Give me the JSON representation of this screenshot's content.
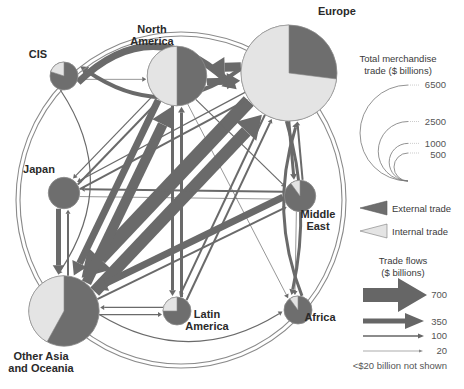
{
  "chart_data": {
    "type": "flow-map",
    "title": "",
    "colors": {
      "external": "#6e6e6e",
      "internal": "#e4e4e4",
      "flow": "#6a6a6a",
      "outline": "#8a8a8a"
    },
    "regions": [
      {
        "id": "europe",
        "label_lines": [
          "Europe"
        ],
        "total_trade": 6500,
        "internal_share": 0.73
      },
      {
        "id": "north-america",
        "label_lines": [
          "North",
          "America"
        ],
        "total_trade": 2500,
        "internal_share": 0.5
      },
      {
        "id": "cis",
        "label_lines": [
          "CIS"
        ],
        "total_trade": 500,
        "internal_share": 0.2
      },
      {
        "id": "japan",
        "label_lines": [
          "Japan"
        ],
        "total_trade": 700,
        "internal_share": 0.0
      },
      {
        "id": "middle-east",
        "label_lines": [
          "Middle",
          "East"
        ],
        "total_trade": 700,
        "internal_share": 0.1
      },
      {
        "id": "other-asia",
        "label_lines": [
          "Other Asia",
          "and Oceania"
        ],
        "total_trade": 3500,
        "internal_share": 0.42
      },
      {
        "id": "latin-america",
        "label_lines": [
          "Latin",
          "America"
        ],
        "total_trade": 500,
        "internal_share": 0.25
      },
      {
        "id": "africa",
        "label_lines": [
          "Africa"
        ],
        "total_trade": 500,
        "internal_share": 0.1
      }
    ],
    "flows": [
      {
        "from": "cis",
        "to": "europe",
        "value": 350
      },
      {
        "from": "europe",
        "to": "cis",
        "value": 200
      },
      {
        "from": "north-america",
        "to": "europe",
        "value": 350
      },
      {
        "from": "europe",
        "to": "north-america",
        "value": 450
      },
      {
        "from": "cis",
        "to": "north-america",
        "value": 20
      },
      {
        "from": "europe",
        "to": "other-asia",
        "value": 700
      },
      {
        "from": "other-asia",
        "to": "europe",
        "value": 600
      },
      {
        "from": "other-asia",
        "to": "north-america",
        "value": 500
      },
      {
        "from": "north-america",
        "to": "other-asia",
        "value": 350
      },
      {
        "from": "japan",
        "to": "other-asia",
        "value": 250
      },
      {
        "from": "other-asia",
        "to": "japan",
        "value": 100
      },
      {
        "from": "middle-east",
        "to": "other-asia",
        "value": 350
      },
      {
        "from": "other-asia",
        "to": "middle-east",
        "value": 100
      },
      {
        "from": "europe",
        "to": "middle-east",
        "value": 150
      },
      {
        "from": "middle-east",
        "to": "europe",
        "value": 100
      },
      {
        "from": "middle-east",
        "to": "japan",
        "value": 100
      },
      {
        "from": "japan",
        "to": "middle-east",
        "value": 20
      },
      {
        "from": "north-america",
        "to": "latin-america",
        "value": 150
      },
      {
        "from": "latin-america",
        "to": "north-america",
        "value": 150
      },
      {
        "from": "other-asia",
        "to": "latin-america",
        "value": 50
      },
      {
        "from": "latin-america",
        "to": "other-asia",
        "value": 50
      },
      {
        "from": "europe",
        "to": "africa",
        "value": 150
      },
      {
        "from": "africa",
        "to": "europe",
        "value": 150
      },
      {
        "from": "north-america",
        "to": "africa",
        "value": 20
      },
      {
        "from": "middle-east",
        "to": "africa",
        "value": 20
      },
      {
        "from": "japan",
        "to": "north-america",
        "value": 100
      },
      {
        "from": "north-america",
        "to": "japan",
        "value": 50
      },
      {
        "from": "europe",
        "to": "japan",
        "value": 50
      },
      {
        "from": "japan",
        "to": "europe",
        "value": 100
      },
      {
        "from": "europe",
        "to": "latin-america",
        "value": 100
      },
      {
        "from": "latin-america",
        "to": "europe",
        "value": 100
      },
      {
        "from": "north-america",
        "to": "middle-east",
        "value": 50
      },
      {
        "from": "cis",
        "to": "other-asia",
        "value": 50
      },
      {
        "from": "other-asia",
        "to": "africa",
        "value": 50
      }
    ]
  },
  "legend": {
    "size_title_lines": [
      "Total merchandise",
      "trade ($ billions)"
    ],
    "size_values": [
      "6500",
      "2500",
      "1000",
      "500"
    ],
    "external_label": "External trade",
    "internal_label": "Internal trade",
    "flows_title_lines": [
      "Trade flows",
      "($ billions)"
    ],
    "flow_values": [
      "700",
      "350",
      "100",
      "20"
    ],
    "footnote": "<$20 billion not shown"
  }
}
